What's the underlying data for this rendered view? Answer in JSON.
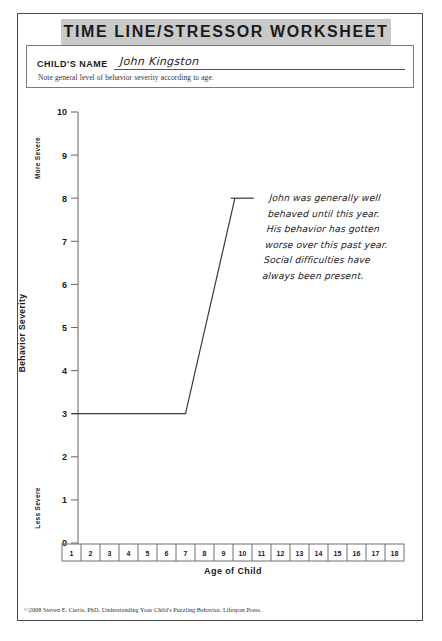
{
  "header": {
    "title": "TIME LINE/STRESSOR WORKSHEET"
  },
  "name_field": {
    "label": "CHILD'S NAME",
    "value": "John Kingston",
    "note": "Note general level of behavior severity according to age."
  },
  "chart_data": {
    "type": "line",
    "title": "",
    "xlabel": "Age of Child",
    "ylabel": "Behavior Severity",
    "y_top_label": "More Severe",
    "y_bottom_label": "Less Severe",
    "yticks": [
      "10",
      "9",
      "8",
      "7",
      "6",
      "5",
      "4",
      "3",
      "2",
      "1",
      "0"
    ],
    "ylim": [
      0,
      10
    ],
    "xticks": [
      "1",
      "2",
      "3",
      "4",
      "5",
      "6",
      "7",
      "8",
      "9",
      "10",
      "11",
      "12",
      "13",
      "14",
      "15",
      "16",
      "17",
      "18"
    ],
    "xlim": [
      1,
      18
    ],
    "grid": false,
    "legend": "none",
    "series": [
      {
        "name": "Behavior severity over age",
        "x": [
          1,
          7,
          9.6
        ],
        "values": [
          3,
          3,
          8
        ]
      }
    ],
    "annotation": {
      "attach_x": 9.6,
      "attach_y": 8,
      "lines": [
        "John was generally well",
        "behaved until this year.",
        "His behavior has gotten",
        "worse over this past year.",
        "Social difficulties have",
        "always been present."
      ]
    },
    "line_color": "#3a3a3a"
  },
  "footer": {
    "credit": "©2008 Steven E. Curtis, PhD, Understanding Your Child's Puzzling Behavior, Lifespan Press."
  }
}
